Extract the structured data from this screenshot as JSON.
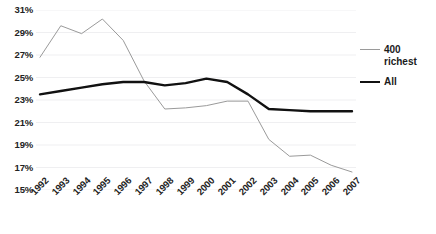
{
  "chart_data": {
    "type": "line",
    "title": "",
    "xlabel": "",
    "ylabel": "",
    "categories": [
      "1992",
      "1993",
      "1994",
      "1995",
      "1996",
      "1997",
      "1998",
      "1999",
      "2000",
      "2001",
      "2002",
      "2003",
      "2004",
      "2005",
      "2006",
      "2007"
    ],
    "ylim": [
      15,
      31
    ],
    "ytick_labels": [
      "31%",
      "29%",
      "27%",
      "25%",
      "23%",
      "21%",
      "19%",
      "17%",
      "15%"
    ],
    "ytick_values": [
      31,
      29,
      27,
      25,
      23,
      21,
      19,
      17,
      15
    ],
    "grid": true,
    "legend_position": "right",
    "series": [
      {
        "name": "400 richest",
        "color": "#9a9a9a",
        "width": 1,
        "values": [
          26.8,
          29.6,
          28.9,
          30.2,
          28.3,
          24.7,
          22.2,
          22.3,
          22.5,
          22.9,
          22.9,
          19.5,
          18.0,
          18.1,
          17.2,
          16.6
        ]
      },
      {
        "name": "All",
        "color": "#111111",
        "width": 2.4,
        "values": [
          23.5,
          23.8,
          24.1,
          24.4,
          24.6,
          24.6,
          24.3,
          24.5,
          24.9,
          24.6,
          23.5,
          22.2,
          22.1,
          22.0,
          22.0,
          22.0
        ]
      }
    ]
  },
  "legend": {
    "entries": [
      {
        "label": "400 richest",
        "style": "thin"
      },
      {
        "label": "All",
        "style": "thick"
      }
    ]
  }
}
